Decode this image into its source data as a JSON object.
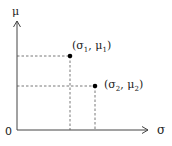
{
  "diagram": {
    "type": "coordinate-plot",
    "axes": {
      "origin_label": "0",
      "x_label": "σ",
      "y_label": "μ",
      "color": "#444444"
    },
    "points": [
      {
        "id": "p1",
        "label_open": "(σ",
        "label_sub1": "1",
        "label_sep": ", μ",
        "label_sub2": "1",
        "label_close": ")",
        "full_label": "(σ1, μ1)"
      },
      {
        "id": "p2",
        "label_open": "(σ",
        "label_sub1": "2",
        "label_sep": ", μ",
        "label_sub2": "2",
        "label_close": ")",
        "full_label": "(σ2, μ2)"
      }
    ],
    "guide_line_style": "dashed",
    "point_color": "#000000"
  }
}
